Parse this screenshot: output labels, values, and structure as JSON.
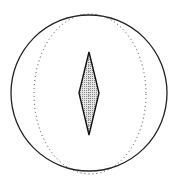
{
  "diagram": {
    "outer_circle": {
      "cx": 89,
      "cy": 93,
      "r": 78,
      "stroke": "#222222"
    },
    "inner_ellipse": {
      "cx": 90,
      "cy": 94,
      "rx": 56,
      "ry": 80,
      "stroke": "#444444",
      "style": "dotted"
    },
    "needle": {
      "points": "89,52 99,93 89,135 79,93",
      "fill": "#bdbdbd",
      "stroke": "#111111"
    }
  }
}
